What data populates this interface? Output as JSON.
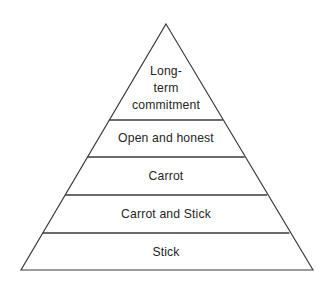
{
  "diagram": {
    "type": "pyramid",
    "title": "",
    "background_color": "#ffffff",
    "stroke_color": "#3b3b3b",
    "text_color": "#262626",
    "apex": {
      "x": 166,
      "y": 24
    },
    "base_left": {
      "x": 21,
      "y": 270
    },
    "base_right": {
      "x": 313,
      "y": 270
    },
    "divider_y": [
      120,
      157,
      195,
      233
    ],
    "tiers": [
      {
        "index": 1,
        "position": "top",
        "label": "Long-term commitment",
        "lines": [
          "Long-",
          "term",
          "commitment"
        ],
        "line1": "Long-",
        "line2": "term",
        "line3": "commitment",
        "text_center": {
          "x": 166,
          "y": 88
        }
      },
      {
        "index": 2,
        "position": "second",
        "label": "Open and honest",
        "lines": [
          "Open and honest"
        ],
        "line1": "Open and honest",
        "text_center": {
          "x": 166,
          "y": 138
        }
      },
      {
        "index": 3,
        "position": "middle",
        "label": "Carrot",
        "lines": [
          "Carrot"
        ],
        "line1": "Carrot",
        "text_center": {
          "x": 166,
          "y": 176
        }
      },
      {
        "index": 4,
        "position": "fourth",
        "label": "Carrot and Stick",
        "lines": [
          "Carrot and Stick"
        ],
        "line1": "Carrot and Stick",
        "text_center": {
          "x": 166,
          "y": 214
        }
      },
      {
        "index": 5,
        "position": "base",
        "label": "Stick",
        "lines": [
          "Stick"
        ],
        "line1": "Stick",
        "text_center": {
          "x": 166,
          "y": 252
        }
      }
    ]
  }
}
